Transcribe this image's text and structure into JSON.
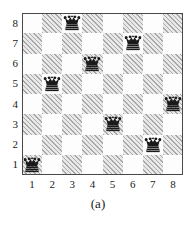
{
  "figure": {
    "caption": "(a)",
    "board_size": 8,
    "x_axis": {
      "ticks": [
        "1",
        "2",
        "3",
        "4",
        "5",
        "6",
        "7",
        "8"
      ]
    },
    "y_axis": {
      "ticks": [
        "8",
        "7",
        "6",
        "5",
        "4",
        "3",
        "2",
        "1"
      ]
    },
    "colors": {
      "light_square": "#fdfdfd",
      "dark_square": "#b8b8b8",
      "border": "#4a4a4a",
      "queen": "#1a1a1a",
      "text": "#1c1c1c"
    },
    "pieces": {
      "name": "queen",
      "count": 8,
      "positions": [
        {
          "column": 1,
          "row": 1
        },
        {
          "column": 2,
          "row": 5
        },
        {
          "column": 3,
          "row": 8
        },
        {
          "column": 4,
          "row": 6
        },
        {
          "column": 5,
          "row": 3
        },
        {
          "column": 6,
          "row": 7
        },
        {
          "column": 7,
          "row": 2
        },
        {
          "column": 8,
          "row": 4
        }
      ]
    }
  },
  "chart_data": {
    "type": "scatter",
    "title": "",
    "subtitle": "",
    "xlabel": "",
    "ylabel": "",
    "x": [
      1,
      2,
      3,
      4,
      5,
      6,
      7,
      8
    ],
    "y": [
      1,
      5,
      8,
      6,
      3,
      7,
      2,
      4
    ],
    "xticklabels": [
      "1",
      "2",
      "3",
      "4",
      "5",
      "6",
      "7",
      "8"
    ],
    "yticklabels": [
      "1",
      "2",
      "3",
      "4",
      "5",
      "6",
      "7",
      "8"
    ],
    "xlim": [
      0.5,
      8.5
    ],
    "ylim": [
      0.5,
      8.5
    ],
    "grid": true,
    "legend": null,
    "annotations": [
      "(a)"
    ],
    "marker": "queen",
    "series": [
      {
        "name": "8-queens solution",
        "values": [
          1,
          5,
          8,
          6,
          3,
          7,
          2,
          4
        ]
      }
    ]
  }
}
